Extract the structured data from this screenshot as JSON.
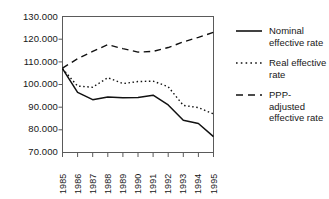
{
  "chart_data": {
    "type": "line",
    "title": "",
    "xlabel": "",
    "ylabel": "",
    "categories": [
      "1985",
      "1986",
      "1987",
      "1988",
      "1989",
      "1990",
      "1991",
      "1992",
      "1993",
      "1994",
      "1995"
    ],
    "x": [
      1985,
      1986,
      1987,
      1988,
      1989,
      1990,
      1991,
      1992,
      1993,
      1994,
      1995
    ],
    "ylim": [
      70000,
      130000
    ],
    "xlim": [
      1985,
      1995
    ],
    "yticks": [
      "70.000",
      "80.000",
      "90.000",
      "100.000",
      "110.000",
      "120.000",
      "130.000"
    ],
    "ytick_values": [
      70000,
      80000,
      90000,
      100000,
      110000,
      120000,
      130000
    ],
    "grid": false,
    "legend_position": "right",
    "series": [
      {
        "name": "Nominal effective rate",
        "style": "solid",
        "color": "#111111",
        "values": [
          107000,
          96500,
          93300,
          94500,
          94200,
          94300,
          95300,
          91000,
          84200,
          82800,
          77000
        ]
      },
      {
        "name": "Real effective rate",
        "style": "dotted",
        "color": "#111111",
        "values": [
          107000,
          99300,
          98800,
          103000,
          100400,
          101300,
          101500,
          99000,
          90800,
          89800,
          87000
        ]
      },
      {
        "name": "PPP-adjusted effective rate",
        "style": "dashed",
        "color": "#111111",
        "values": [
          107200,
          111400,
          114600,
          117600,
          115800,
          114300,
          114600,
          116300,
          118800,
          120800,
          123000
        ]
      }
    ]
  },
  "axes": {
    "y_tick_labels": [
      "130.000",
      "120.000",
      "110.000",
      "100.000",
      "90.000",
      "80.000",
      "70.000"
    ],
    "x_tick_labels": [
      "1985",
      "1986",
      "1987",
      "1988",
      "1989",
      "1990",
      "1991",
      "1992",
      "1993",
      "1994",
      "1995"
    ]
  },
  "legend": {
    "items": [
      {
        "key": "solid-line-key",
        "label": "Nominal effective rate"
      },
      {
        "key": "dotted-line-key",
        "label": "Real effective rate"
      },
      {
        "key": "dashed-line-key",
        "label": "PPP-adjusted effective rate"
      }
    ]
  },
  "colors": {
    "line": "#111111",
    "frame": "#5a5a5a",
    "text": "#171717",
    "background": "#ffffff"
  }
}
